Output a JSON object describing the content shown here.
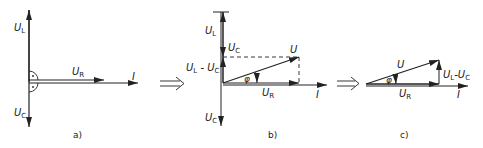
{
  "figure": {
    "panels": [
      {
        "id": "a",
        "caption": "a)",
        "labels": {
          "ul": {
            "main": "U",
            "sub": "L"
          },
          "ur": {
            "main": "U",
            "sub": "R"
          },
          "uc": {
            "main": "U",
            "sub": "C"
          },
          "current": "I"
        }
      },
      {
        "id": "b",
        "caption": "b)",
        "labels": {
          "ul": {
            "main": "U",
            "sub": "L"
          },
          "uc_top": {
            "main": "U",
            "sub": "C"
          },
          "ul_minus_uc": {
            "main1": "U",
            "sub1": "L",
            "sep": " - ",
            "main2": "U",
            "sub2": "C"
          },
          "u": "U",
          "phi": "φ",
          "ur": {
            "main": "U",
            "sub": "R"
          },
          "current": "I",
          "uc_bottom": {
            "main": "U",
            "sub": "C"
          }
        }
      },
      {
        "id": "c",
        "caption": "c)",
        "labels": {
          "u": "U",
          "phi": "φ",
          "ul_minus_uc": {
            "main1": "U",
            "sub1": "L",
            "sep": "-",
            "main2": "U",
            "sub2": "C"
          },
          "ur": {
            "main": "U",
            "sub": "R"
          },
          "current": "I"
        }
      }
    ],
    "arrows_between": [
      "implies-arrow",
      "implies-arrow"
    ]
  }
}
